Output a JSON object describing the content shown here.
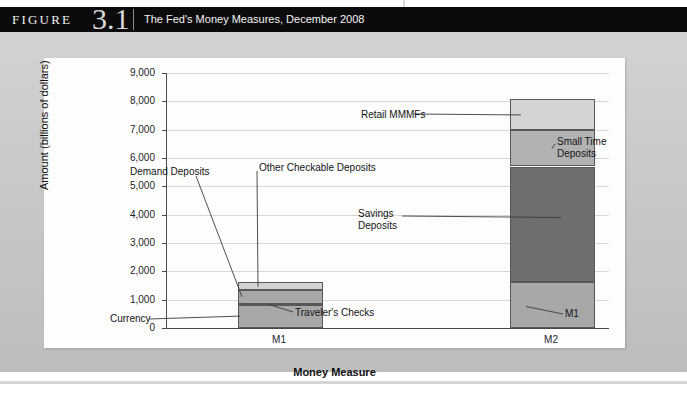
{
  "figure": {
    "label_word": "FIGURE",
    "number": "3.1",
    "caption": "The Fed's Money Measures, December 2008"
  },
  "colors": {
    "band": "#0b0b0b",
    "outer": "#c9c9c9",
    "panel": "#fdfdfd",
    "axis": "#4a4a4a",
    "grid": "#d7d7d7",
    "currency": "#a8a8a8",
    "travelers_checks": "#4b4b4b",
    "demand_deposits": "#a8a8a8",
    "other_checkable": "#d2d2d2",
    "m1_segment": "#a8a8a8",
    "savings_deposits": "#6e6e6e",
    "small_time_deposits": "#b2b2b2",
    "retail_mmmfs": "#d4d4d4"
  },
  "chart_data": {
    "type": "bar",
    "stacked": true,
    "title": "The Fed's Money Measures, December 2008",
    "xlabel": "Money Measure",
    "ylabel": "Amount (billions of dollars)",
    "categories": [
      "M1",
      "M2"
    ],
    "ylim": [
      0,
      9000
    ],
    "ytick_step": 1000,
    "ytick_labels": [
      "0",
      "1,000",
      "2,000",
      "3,000",
      "4,000",
      "5,000",
      "6,000",
      "7,000",
      "8,000",
      "9,000"
    ],
    "grid": true,
    "legend": "none (direct labels with leader lines)",
    "series": [
      {
        "name": "Currency",
        "category": "M1",
        "value": 800,
        "bottom": 0,
        "color": "#a8a8a8"
      },
      {
        "name": "Traveler's Checks",
        "category": "M1",
        "value": 50,
        "bottom": 800,
        "color": "#4b4b4b"
      },
      {
        "name": "Demand Deposits",
        "category": "M1",
        "value": 490,
        "bottom": 850,
        "color": "#a8a8a8"
      },
      {
        "name": "Other Checkable Deposits",
        "category": "M1",
        "value": 270,
        "bottom": 1340,
        "color": "#d2d2d2"
      },
      {
        "name": "M1",
        "category": "M2",
        "value": 1610,
        "bottom": 0,
        "color": "#a8a8a8"
      },
      {
        "name": "Savings Deposits",
        "category": "M2",
        "value": 4090,
        "bottom": 1610,
        "color": "#6e6e6e"
      },
      {
        "name": "Small Time Deposits",
        "category": "M2",
        "value": 1300,
        "bottom": 5700,
        "color": "#b2b2b2"
      },
      {
        "name": "Retail MMMFs",
        "category": "M2",
        "value": 1100,
        "bottom": 7000,
        "color": "#d4d4d4"
      }
    ],
    "totals": {
      "M1": 1610,
      "M2": 8100
    },
    "annotations": [
      {
        "text": "Demand Deposits",
        "target": "M1 / Demand Deposits"
      },
      {
        "text": "Other Checkable Deposits",
        "target": "M1 / Other Checkable Deposits"
      },
      {
        "text": "Currency",
        "target": "M1 / Currency"
      },
      {
        "text": "Traveler's Checks",
        "target": "M1 / Traveler's Checks"
      },
      {
        "text": "Retail MMMFs",
        "target": "M2 / Retail MMMFs"
      },
      {
        "text": "Small Time Deposits",
        "target": "M2 / Small Time Deposits"
      },
      {
        "text": "Savings Deposits",
        "target": "M2 / Savings Deposits"
      },
      {
        "text": "M1",
        "target": "M2 / M1"
      }
    ]
  },
  "annotation_text": {
    "demand_deposits": "Demand Deposits",
    "other_checkable": "Other Checkable Deposits",
    "currency": "Currency",
    "travelers_checks": "Traveler's Checks",
    "retail_mmmfs": "Retail MMMFs",
    "small_time_line1": "Small Time",
    "small_time_line2": "Deposits",
    "savings_line1": "Savings",
    "savings_line2": "Deposits",
    "m1_callout": "M1"
  }
}
